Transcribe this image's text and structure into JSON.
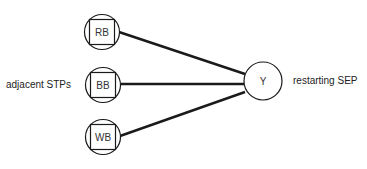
{
  "diagram": {
    "left_label": "adjacent STPs",
    "right_label": "restarting SEP",
    "center_node": {
      "label": "Y"
    },
    "nodes": [
      {
        "label": "RB"
      },
      {
        "label": "BB"
      },
      {
        "label": "WB"
      }
    ],
    "colors": {
      "stroke": "#1a1a1a",
      "background": "#ffffff",
      "text": "#222222"
    }
  }
}
